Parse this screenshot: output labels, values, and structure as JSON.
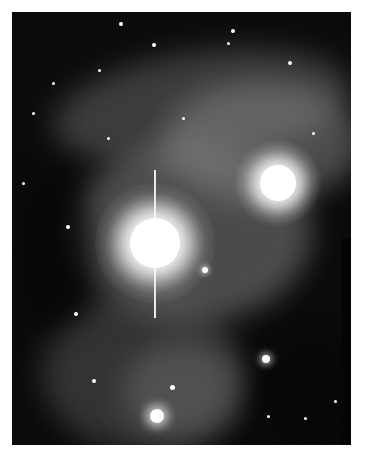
{
  "image": {
    "description": "Grayscale astronomical photograph of a reflection nebula with two bright stars and wispy filaments",
    "colors": {
      "background": "#0b0b0b",
      "nebula": "#7a7a7a",
      "star": "#ffffff"
    },
    "bright_stars": [
      {
        "name": "primary-star",
        "x": 143,
        "y": 231,
        "radius": 26
      },
      {
        "name": "secondary-star",
        "x": 266,
        "y": 171,
        "radius": 20
      }
    ]
  }
}
